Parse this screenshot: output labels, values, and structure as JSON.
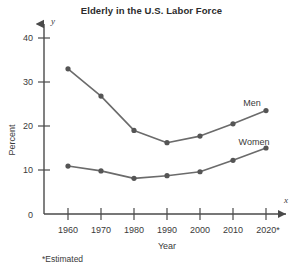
{
  "chart_data": {
    "type": "line",
    "title": "Elderly in the U.S. Labor Force",
    "xlabel": "Year",
    "ylabel": "Percent",
    "categories": [
      "1960",
      "1970",
      "1980",
      "1990",
      "2000",
      "2010",
      "2020*"
    ],
    "x": [
      1960,
      1970,
      1980,
      1990,
      2000,
      2010,
      2020
    ],
    "series": [
      {
        "name": "Men",
        "values": [
          33,
          26.8,
          19,
          16.2,
          17.7,
          20.5,
          23.5
        ]
      },
      {
        "name": "Women",
        "values": [
          10.9,
          9.8,
          8.1,
          8.7,
          9.6,
          12.2,
          15
        ]
      }
    ],
    "xlim": [
      1955,
      2025
    ],
    "ylim": [
      0,
      44
    ],
    "ytick_labels": [
      "0",
      "10",
      "20",
      "30",
      "40"
    ],
    "ytick_values": [
      0,
      10,
      20,
      30,
      40
    ],
    "grid": false,
    "legend": "inline-series-labels",
    "axis_variable_x": "x",
    "axis_variable_y": "y",
    "footnote": "*Estimated",
    "colors": {
      "line": "#6b6b6b",
      "marker": "#555555",
      "axis": "#4a4a4a",
      "text": "#3a3a3a",
      "background": "#ffffff"
    }
  },
  "labels": {
    "series_men": "Men",
    "series_women": "Women",
    "y_axis_title": "Percent",
    "x_axis_title": "Year",
    "x_tick_1960": "1960",
    "x_tick_1970": "1970",
    "x_tick_1980": "1980",
    "x_tick_1990": "1990",
    "x_tick_2000": "2000",
    "x_tick_2010": "2010",
    "x_tick_2020": "2020*",
    "y_tick_0": "0",
    "y_tick_10": "10",
    "y_tick_20": "20",
    "y_tick_30": "30",
    "y_tick_40": "40",
    "axis_var_x": "x",
    "axis_var_y": "y",
    "footnote": "*Estimated",
    "title": "Elderly in the U.S. Labor Force"
  }
}
